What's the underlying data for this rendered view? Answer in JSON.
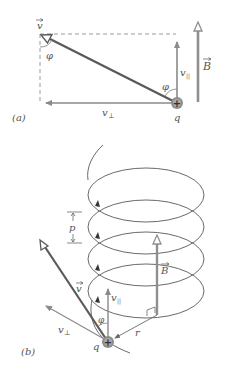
{
  "colors": {
    "background": "#ffffff",
    "velocity": "#5a5a5a",
    "component": "#8a8a8a",
    "field": "#8f8f8f",
    "helix": "#6a6a6a",
    "dashed": "#9a9a9a",
    "charge": "#8c8c8c",
    "text": "#555555"
  },
  "panel_a": {
    "label": "(a)",
    "velocity_label": "v",
    "angle_label_top": "φ",
    "angle_label_bottom": "φ",
    "v_parallel_label": "v",
    "v_parallel_sub": "||",
    "v_perp_label": "v",
    "v_perp_sub": "⊥",
    "field_label": "B",
    "charge_label": "q",
    "charge_sign": "+"
  },
  "panel_b": {
    "label": "(b)",
    "pitch_label": "p",
    "velocity_label": "v",
    "v_parallel_label": "v",
    "v_parallel_sub": "||",
    "v_perp_label": "v",
    "v_perp_sub": "⊥",
    "angle_label": "φ",
    "field_label": "B",
    "radius_label": "r",
    "charge_label": "q",
    "charge_sign": "+"
  }
}
